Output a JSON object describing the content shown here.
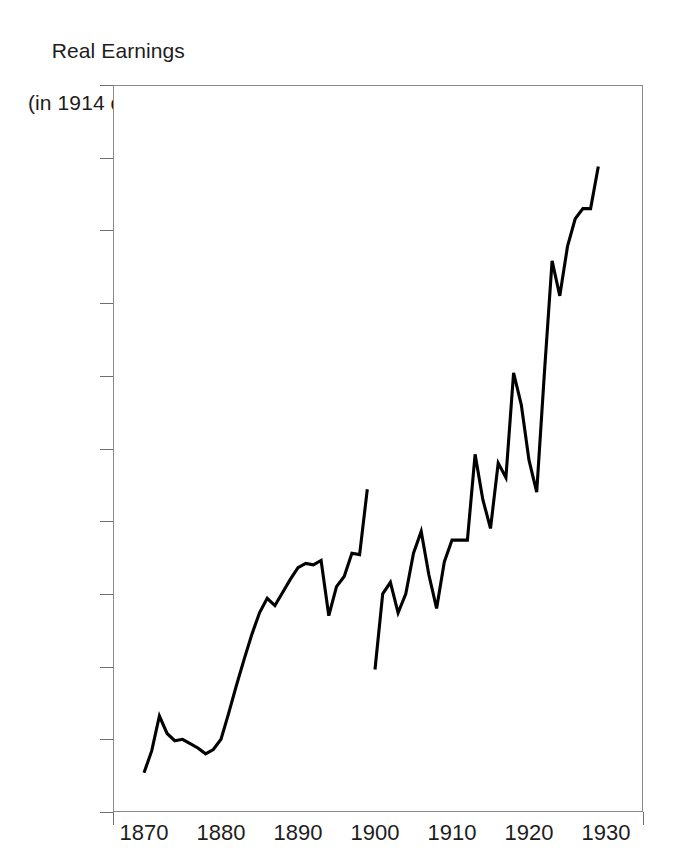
{
  "chart_data": {
    "type": "line",
    "title": "Real Earnings",
    "subtitle": "(in 1914 dollars)",
    "title_line1": "Real Earnings",
    "title_line2": "(in 1914 dollars)",
    "xlabel": "",
    "ylabel": "Real Earnings (in 1914 dollars)",
    "xlim": [
      1867,
      1932
    ],
    "ylim": [
      350,
      850
    ],
    "grid": false,
    "legend": "none",
    "y_tick_labels": [
      "$850",
      "$800",
      "$750",
      "$700",
      "$650",
      "$600",
      "$550",
      "$500",
      "$450",
      "$400",
      "$350"
    ],
    "y_tick_values": [
      850,
      800,
      750,
      700,
      650,
      600,
      550,
      500,
      450,
      400,
      350
    ],
    "x_tick_labels": [
      "1870",
      "1880",
      "1890",
      "1900",
      "1910",
      "1920",
      "1930"
    ],
    "x_tick_values": [
      1870,
      1880,
      1890,
      1900,
      1910,
      1920,
      1930
    ],
    "line_color": "#000000",
    "frame_color": "#8a8a8a",
    "series": [
      {
        "name": "Real earnings 1870-1899",
        "x": [
          1870,
          1871,
          1872,
          1873,
          1874,
          1875,
          1876,
          1877,
          1878,
          1879,
          1880,
          1881,
          1882,
          1883,
          1884,
          1885,
          1886,
          1887,
          1888,
          1889,
          1890,
          1891,
          1892,
          1893,
          1894,
          1895,
          1896,
          1897,
          1898,
          1899
        ],
        "values": [
          377,
          392,
          416,
          404,
          399,
          400,
          397,
          394,
          390,
          393,
          400,
          418,
          437,
          455,
          472,
          487,
          497,
          492,
          501,
          510,
          518,
          521,
          520,
          523,
          485,
          505,
          512,
          528,
          527,
          572
        ]
      },
      {
        "name": "Real earnings 1900-1929",
        "x": [
          1900,
          1901,
          1902,
          1903,
          1904,
          1905,
          1906,
          1907,
          1908,
          1909,
          1910,
          1911,
          1912,
          1913,
          1914,
          1915,
          1916,
          1917,
          1918,
          1919,
          1920,
          1921,
          1922,
          1923,
          1924,
          1925,
          1926,
          1927,
          1928,
          1929
        ],
        "values": [
          448,
          500,
          508,
          487,
          500,
          528,
          543,
          513,
          490,
          522,
          537,
          537,
          537,
          596,
          565,
          545,
          590,
          580,
          652,
          630,
          592,
          570,
          652,
          729,
          705,
          739,
          758,
          765,
          765,
          794
        ]
      }
    ]
  }
}
